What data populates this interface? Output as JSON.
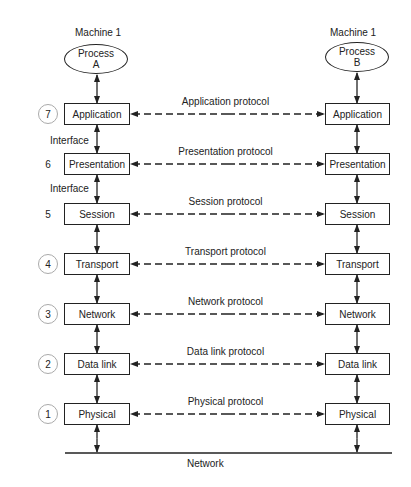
{
  "machines": {
    "left": {
      "title": "Machine 1",
      "process_line1": "Process",
      "process_line2": "A"
    },
    "right": {
      "title": "Machine 1",
      "process_line1": "Process",
      "process_line2": "B"
    }
  },
  "layers": [
    {
      "number": "7",
      "circled": true,
      "name": "Application",
      "protocol": "Application protocol"
    },
    {
      "number": "6",
      "circled": false,
      "name": "Presentation",
      "protocol": "Presentation protocol"
    },
    {
      "number": "5",
      "circled": false,
      "name": "Session",
      "protocol": "Session protocol"
    },
    {
      "number": "4",
      "circled": true,
      "name": "Transport",
      "protocol": "Transport protocol"
    },
    {
      "number": "3",
      "circled": true,
      "name": "Network",
      "protocol": "Network protocol"
    },
    {
      "number": "2",
      "circled": true,
      "name": "Data link",
      "protocol": "Data link protocol"
    },
    {
      "number": "1",
      "circled": true,
      "name": "Physical",
      "protocol": "Physical protocol"
    }
  ],
  "interfaces": {
    "label_7_6": "Interface",
    "label_6_5": "Interface"
  },
  "network": {
    "label": "Network"
  },
  "colors": {
    "line": "#222222",
    "circle": "#aaaaaa",
    "background": "#ffffff"
  }
}
